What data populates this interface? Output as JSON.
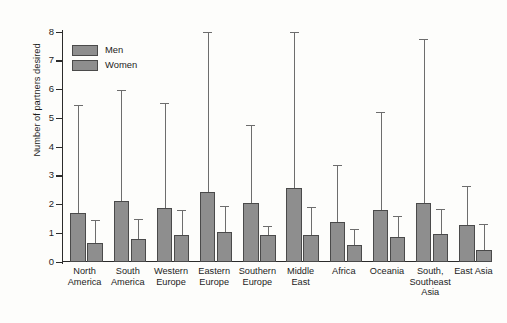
{
  "chart_data": {
    "type": "bar",
    "title": "",
    "xlabel": "",
    "ylabel": "Number of partners desired",
    "ylim": [
      0,
      8
    ],
    "yticks": [
      0,
      1,
      2,
      3,
      4,
      5,
      6,
      7,
      8
    ],
    "ytick_labels": [
      "0",
      "1",
      "2",
      "3",
      "4",
      "5",
      "6",
      "7",
      "8"
    ],
    "grid": false,
    "legend_position": "top-left",
    "error_bars": "upper-only",
    "categories": [
      "North\nAmerica",
      "South\nAmerica",
      "Western\nEurope",
      "Eastern\nEurope",
      "Southern\nEurope",
      "Middle\nEast",
      "Africa",
      "Oceania",
      "South,\nSoutheast\nAsia",
      "East Asia"
    ],
    "series": [
      {
        "name": "Men",
        "color": "#8e8e8e",
        "values": [
          1.7,
          2.13,
          1.87,
          2.45,
          2.06,
          2.58,
          1.38,
          1.8,
          2.05,
          1.28
        ],
        "error_upper": [
          5.42,
          5.95,
          5.5,
          7.97,
          4.73,
          7.97,
          3.33,
          5.2,
          7.73,
          2.6
        ]
      },
      {
        "name": "Women",
        "color": "#8e8e8e",
        "values": [
          0.67,
          0.81,
          0.94,
          1.04,
          0.95,
          0.93,
          0.58,
          0.86,
          0.97,
          0.42
        ],
        "error_upper": [
          1.42,
          1.47,
          1.79,
          1.91,
          1.23,
          1.88,
          1.12,
          1.57,
          1.81,
          1.3
        ]
      }
    ]
  },
  "legend": {
    "items": [
      {
        "label": "Men"
      },
      {
        "label": "Women"
      }
    ]
  },
  "axis": {
    "y_title": "Number of partners desired"
  }
}
